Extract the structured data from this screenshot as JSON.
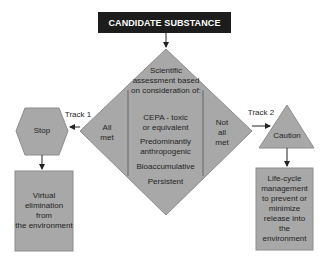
{
  "colors": {
    "shape_fill": "#a8a8a8",
    "shape_stroke": "#888888",
    "header_bg": "#1c1c1c",
    "header_text": "#ffffff",
    "arrow": "#222222"
  },
  "header": {
    "title": "CANDIDATE SUBSTANCE"
  },
  "assessment": {
    "intro_lines": [
      "Scientific",
      "assessment based",
      "on consideration of:"
    ],
    "criteria": [
      {
        "lines": [
          "CEPA - toxic",
          "or equivalent"
        ]
      },
      {
        "lines": [
          "Predominantly",
          "anthropogenic"
        ]
      },
      {
        "lines": [
          "Bioaccumulative"
        ]
      },
      {
        "lines": [
          "Persistent"
        ]
      }
    ],
    "left_outcome": [
      "All",
      "met"
    ],
    "right_outcome": [
      "Not",
      "all",
      "met"
    ]
  },
  "track1": {
    "label": "Track 1",
    "node": "Stop",
    "result": [
      "Virtual",
      "elimination",
      "from",
      "the environment"
    ]
  },
  "track2": {
    "label": "Track 2",
    "node": "Caution",
    "result": [
      "Life-cycle",
      "management",
      "to prevent or",
      "minimize",
      "release into",
      "the environment"
    ]
  }
}
